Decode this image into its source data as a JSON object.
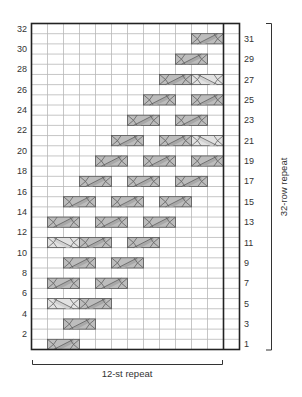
{
  "chart": {
    "columns": 13,
    "rows": 32,
    "grid": {
      "left": 31.5,
      "top": 23.5,
      "cell_w": 16,
      "cell_h": 10.1875
    },
    "repeat_boundary_col": 12,
    "left_row_labels": [
      "2",
      "4",
      "6",
      "8",
      "10",
      "12",
      "14",
      "16",
      "18",
      "20",
      "22",
      "24",
      "26",
      "28",
      "30",
      "32"
    ],
    "right_row_labels": [
      "1",
      "3",
      "5",
      "7",
      "9",
      "11",
      "13",
      "15",
      "17",
      "19",
      "21",
      "23",
      "25",
      "27",
      "29",
      "31"
    ],
    "stitch_repeat_label": "12-st repeat",
    "row_repeat_label": "32-row repeat",
    "colors": {
      "grid_line": "#b8b8b8",
      "border": "#222222",
      "cable_dark_fill": "#bdbdbd",
      "cable_dark_band": "#a8a8a8",
      "cable_light_fill": "#e2e2e2",
      "cable_light_band": "#d2d2d2",
      "cable_stroke": "#555555"
    },
    "cables": [
      {
        "row": 1,
        "col": 2,
        "type": "dark"
      },
      {
        "row": 3,
        "col": 3,
        "type": "dark"
      },
      {
        "row": 5,
        "col": 2,
        "type": "light"
      },
      {
        "row": 5,
        "col": 4,
        "type": "dark"
      },
      {
        "row": 7,
        "col": 2,
        "type": "dark"
      },
      {
        "row": 7,
        "col": 5,
        "type": "dark"
      },
      {
        "row": 9,
        "col": 3,
        "type": "dark"
      },
      {
        "row": 9,
        "col": 6,
        "type": "dark"
      },
      {
        "row": 11,
        "col": 2,
        "type": "light"
      },
      {
        "row": 11,
        "col": 4,
        "type": "dark"
      },
      {
        "row": 11,
        "col": 7,
        "type": "dark"
      },
      {
        "row": 13,
        "col": 2,
        "type": "dark"
      },
      {
        "row": 13,
        "col": 5,
        "type": "dark"
      },
      {
        "row": 13,
        "col": 8,
        "type": "dark"
      },
      {
        "row": 15,
        "col": 3,
        "type": "dark"
      },
      {
        "row": 15,
        "col": 6,
        "type": "dark"
      },
      {
        "row": 15,
        "col": 9,
        "type": "dark"
      },
      {
        "row": 17,
        "col": 4,
        "type": "dark"
      },
      {
        "row": 17,
        "col": 7,
        "type": "dark"
      },
      {
        "row": 17,
        "col": 10,
        "type": "dark"
      },
      {
        "row": 19,
        "col": 5,
        "type": "dark"
      },
      {
        "row": 19,
        "col": 8,
        "type": "dark"
      },
      {
        "row": 19,
        "col": 11,
        "type": "dark"
      },
      {
        "row": 21,
        "col": 6,
        "type": "dark"
      },
      {
        "row": 21,
        "col": 9,
        "type": "dark"
      },
      {
        "row": 21,
        "col": 11,
        "type": "light"
      },
      {
        "row": 23,
        "col": 7,
        "type": "dark"
      },
      {
        "row": 23,
        "col": 10,
        "type": "dark"
      },
      {
        "row": 25,
        "col": 8,
        "type": "dark"
      },
      {
        "row": 25,
        "col": 11,
        "type": "dark"
      },
      {
        "row": 27,
        "col": 9,
        "type": "dark"
      },
      {
        "row": 27,
        "col": 11,
        "type": "light"
      },
      {
        "row": 29,
        "col": 10,
        "type": "dark"
      },
      {
        "row": 31,
        "col": 11,
        "type": "dark"
      }
    ],
    "legend_symbols": {
      "dark": "cable-cross-right-icon",
      "light": "cable-cross-left-icon"
    }
  }
}
